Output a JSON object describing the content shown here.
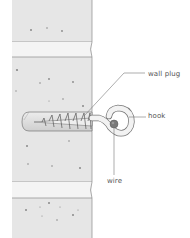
{
  "diagram": {
    "labels": {
      "wall_plug": "wall plug",
      "hook": "hook",
      "wire": "wire"
    },
    "colors": {
      "wall_fill": "#e6e6e6",
      "wall_stroke": "#8a8a8a",
      "mortar_fill": "#f4f4f4",
      "leader_line": "#777777",
      "label_text": "#555555",
      "wire_fill": "#7a7a7a",
      "plug_fill": "#dadada"
    }
  }
}
